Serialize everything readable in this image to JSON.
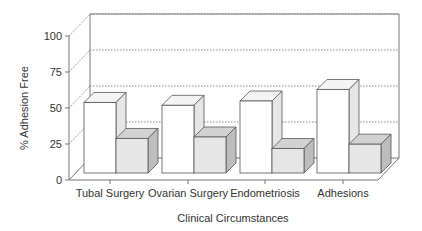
{
  "chart_data": {
    "type": "bar",
    "style": "3d-grouped",
    "title": "",
    "xlabel": "Clinical Circumstances",
    "ylabel": "% Adhesion Free",
    "ylim": [
      0,
      100
    ],
    "yticks": [
      0,
      25,
      50,
      75,
      100
    ],
    "grid": true,
    "grid_style": "dotted",
    "legend": null,
    "categories": [
      "Tubal Surgery",
      "Ovarian Surgery",
      "Endometriosis",
      "Adhesions"
    ],
    "series": [
      {
        "name": "Series 1 (white)",
        "color": "#ffffff",
        "values": [
          49,
          47,
          50,
          58
        ]
      },
      {
        "name": "Series 2 (grey)",
        "color": "#e4e4e4",
        "values": [
          24,
          25,
          17,
          20
        ]
      }
    ]
  },
  "colors": {
    "axis": "#777777",
    "grid": "#888888",
    "bar_outline": "#555555",
    "white_front": "#ffffff",
    "white_top": "#f4f4f4",
    "white_side": "#e6e6e6",
    "grey_front": "#e6e6e6",
    "grey_top": "#d2d2d2",
    "grey_side": "#bdbdbd"
  }
}
